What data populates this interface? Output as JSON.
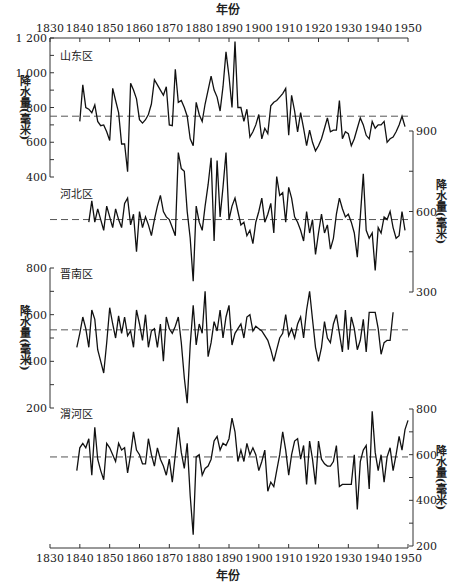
{
  "chart_data": {
    "type": "line",
    "title": "",
    "xlabel_top": "年份",
    "xlabel_bottom": "年份",
    "x_ticks": [
      1830,
      1840,
      1850,
      1860,
      1870,
      1880,
      1890,
      1900,
      1910,
      1920,
      1930,
      1940,
      1950
    ],
    "xlim": [
      1830,
      1950
    ],
    "panels": [
      {
        "name": "山东区",
        "axis_side": "left",
        "ylabel": "降水量(毫米)",
        "yticks": [
          400,
          600,
          800,
          1000,
          1200
        ],
        "ytick_labels": [
          "400",
          "600",
          "800",
          "1 000",
          "1 200"
        ],
        "ylim": [
          400,
          1200
        ],
        "mean": 750,
        "x": [
          1840,
          1841,
          1842,
          1843,
          1844,
          1845,
          1846,
          1847,
          1848,
          1849,
          1850,
          1851,
          1852,
          1853,
          1854,
          1855,
          1856,
          1857,
          1858,
          1859,
          1860,
          1861,
          1862,
          1863,
          1864,
          1865,
          1866,
          1867,
          1868,
          1869,
          1870,
          1871,
          1872,
          1873,
          1874,
          1875,
          1876,
          1877,
          1878,
          1879,
          1880,
          1881,
          1882,
          1883,
          1884,
          1885,
          1886,
          1887,
          1888,
          1889,
          1890,
          1891,
          1892,
          1893,
          1894,
          1895,
          1896,
          1897,
          1898,
          1899,
          1900,
          1901,
          1902,
          1903,
          1904,
          1905,
          1906,
          1907,
          1908,
          1909,
          1910,
          1911,
          1912,
          1913,
          1914,
          1915,
          1916,
          1917,
          1918,
          1919,
          1920,
          1921,
          1922,
          1923,
          1924,
          1925,
          1926,
          1927,
          1928,
          1929,
          1930,
          1931,
          1932,
          1933,
          1934,
          1935,
          1936,
          1937,
          1938,
          1939,
          1940,
          1941,
          1942,
          1943,
          1944,
          1945,
          1946,
          1947,
          1948,
          1949
        ],
        "values": [
          720,
          930,
          800,
          790,
          770,
          815,
          720,
          695,
          700,
          660,
          610,
          910,
          840,
          770,
          590,
          590,
          430,
          940,
          900,
          850,
          730,
          710,
          730,
          760,
          820,
          960,
          930,
          900,
          870,
          920,
          700,
          695,
          1020,
          830,
          840,
          800,
          750,
          620,
          580,
          830,
          760,
          720,
          820,
          900,
          980,
          900,
          860,
          780,
          920,
          1120,
          980,
          800,
          1180,
          800,
          800,
          720,
          790,
          630,
          660,
          700,
          760,
          620,
          680,
          650,
          810,
          830,
          840,
          860,
          880,
          910,
          640,
          870,
          780,
          660,
          770,
          680,
          580,
          670,
          600,
          550,
          580,
          620,
          680,
          740,
          660,
          670,
          670,
          840,
          620,
          660,
          650,
          580,
          620,
          680,
          740,
          700,
          640,
          620,
          720,
          680,
          700,
          700,
          720,
          600,
          620,
          630,
          660,
          700,
          750,
          690
        ]
      },
      {
        "name": "河北区",
        "axis_side": "right",
        "ylabel": "降水量(毫米)",
        "yticks": [
          300,
          600,
          900
        ],
        "ytick_labels": [
          "300",
          "600",
          "900"
        ],
        "ylim": [
          300,
          900
        ],
        "mean": 570,
        "x": [
          1843,
          1844,
          1845,
          1846,
          1847,
          1848,
          1849,
          1850,
          1851,
          1852,
          1853,
          1854,
          1855,
          1856,
          1857,
          1858,
          1859,
          1860,
          1861,
          1862,
          1863,
          1864,
          1865,
          1866,
          1867,
          1868,
          1869,
          1870,
          1871,
          1872,
          1873,
          1874,
          1875,
          1876,
          1877,
          1878,
          1879,
          1880,
          1881,
          1882,
          1883,
          1884,
          1885,
          1886,
          1887,
          1888,
          1889,
          1890,
          1891,
          1892,
          1893,
          1894,
          1895,
          1896,
          1897,
          1898,
          1899,
          1900,
          1901,
          1902,
          1903,
          1904,
          1905,
          1906,
          1907,
          1908,
          1909,
          1910,
          1911,
          1912,
          1913,
          1914,
          1915,
          1916,
          1917,
          1918,
          1919,
          1920,
          1921,
          1922,
          1923,
          1924,
          1925,
          1926,
          1927,
          1928,
          1929,
          1930,
          1931,
          1932,
          1933,
          1934,
          1935,
          1936,
          1937,
          1938,
          1939,
          1940,
          1941,
          1942,
          1943,
          1944,
          1945,
          1946,
          1947,
          1948,
          1949
        ],
        "values": [
          560,
          640,
          560,
          610,
          570,
          530,
          620,
          580,
          540,
          610,
          570,
          540,
          630,
          650,
          550,
          590,
          450,
          600,
          540,
          580,
          550,
          510,
          570,
          620,
          660,
          600,
          580,
          570,
          540,
          510,
          820,
          760,
          750,
          600,
          500,
          340,
          620,
          560,
          530,
          620,
          700,
          800,
          490,
          790,
          580,
          690,
          820,
          570,
          620,
          650,
          600,
          550,
          560,
          510,
          530,
          480,
          560,
          600,
          650,
          560,
          590,
          630,
          520,
          730,
          660,
          670,
          560,
          690,
          650,
          580,
          560,
          530,
          490,
          600,
          520,
          570,
          440,
          520,
          590,
          520,
          550,
          460,
          500,
          590,
          650,
          610,
          580,
          590,
          560,
          520,
          430,
          580,
          740,
          530,
          500,
          520,
          380,
          540,
          520,
          580,
          570,
          600,
          540,
          500,
          510,
          600,
          530
        ]
      },
      {
        "name": "晋南区",
        "axis_side": "left",
        "ylabel": "降水量(毫米)",
        "yticks": [
          200,
          400,
          600,
          800
        ],
        "ytick_labels": [
          "200",
          "400",
          "600",
          "800"
        ],
        "ylim": [
          200,
          800
        ],
        "mean": 535,
        "x": [
          1839,
          1840,
          1841,
          1842,
          1843,
          1844,
          1845,
          1846,
          1847,
          1848,
          1849,
          1850,
          1851,
          1852,
          1853,
          1854,
          1855,
          1856,
          1857,
          1858,
          1859,
          1860,
          1861,
          1862,
          1863,
          1864,
          1865,
          1866,
          1867,
          1868,
          1869,
          1870,
          1871,
          1872,
          1873,
          1874,
          1875,
          1876,
          1877,
          1878,
          1879,
          1880,
          1881,
          1882,
          1883,
          1884,
          1885,
          1886,
          1887,
          1888,
          1889,
          1890,
          1891,
          1892,
          1893,
          1894,
          1895,
          1896,
          1897,
          1898,
          1899,
          1900,
          1901,
          1902,
          1903,
          1904,
          1905,
          1906,
          1907,
          1908,
          1909,
          1910,
          1911,
          1912,
          1913,
          1914,
          1915,
          1916,
          1917,
          1918,
          1919,
          1920,
          1921,
          1922,
          1923,
          1924,
          1925,
          1926,
          1927,
          1928,
          1929,
          1930,
          1931,
          1932,
          1933,
          1934,
          1935,
          1936,
          1937,
          1938,
          1939,
          1940,
          1941,
          1942,
          1943,
          1944,
          1945,
          1946,
          1947,
          1948,
          1949
        ],
        "values": [
          460,
          520,
          590,
          540,
          460,
          620,
          580,
          450,
          400,
          350,
          480,
          630,
          560,
          500,
          595,
          520,
          590,
          510,
          530,
          460,
          620,
          560,
          490,
          600,
          460,
          530,
          540,
          460,
          560,
          400,
          590,
          540,
          520,
          550,
          590,
          480,
          330,
          220,
          470,
          640,
          470,
          560,
          520,
          700,
          420,
          480,
          570,
          530,
          620,
          500,
          590,
          640,
          470,
          520,
          540,
          560,
          500,
          590,
          600,
          530,
          550,
          540,
          530,
          510,
          490,
          450,
          400,
          450,
          500,
          520,
          600,
          510,
          540,
          500,
          560,
          590,
          500,
          620,
          700,
          580,
          460,
          400,
          460,
          570,
          500,
          480,
          560,
          600,
          520,
          440,
          620,
          450,
          590,
          540,
          450,
          490,
          580,
          440,
          610,
          610,
          610,
          540,
          430,
          480,
          490,
          490,
          610
        ]
      },
      {
        "name": "渭河区",
        "axis_side": "right",
        "ylabel": "降水量(毫米)",
        "yticks": [
          200,
          400,
          600,
          800
        ],
        "ytick_labels": [
          "200",
          "400",
          "600",
          "800"
        ],
        "ylim": [
          200,
          800
        ],
        "mean": 590,
        "x": [
          1839,
          1840,
          1841,
          1842,
          1843,
          1844,
          1845,
          1846,
          1847,
          1848,
          1849,
          1850,
          1851,
          1852,
          1853,
          1854,
          1855,
          1856,
          1857,
          1858,
          1859,
          1860,
          1861,
          1862,
          1863,
          1864,
          1865,
          1866,
          1867,
          1868,
          1869,
          1870,
          1871,
          1872,
          1873,
          1874,
          1875,
          1876,
          1877,
          1878,
          1879,
          1880,
          1881,
          1882,
          1883,
          1884,
          1885,
          1886,
          1887,
          1888,
          1889,
          1890,
          1891,
          1892,
          1893,
          1894,
          1895,
          1896,
          1897,
          1898,
          1899,
          1900,
          1901,
          1902,
          1903,
          1904,
          1905,
          1906,
          1907,
          1908,
          1909,
          1910,
          1911,
          1912,
          1913,
          1914,
          1915,
          1916,
          1917,
          1918,
          1919,
          1920,
          1921,
          1922,
          1923,
          1924,
          1925,
          1926,
          1927,
          1928,
          1929,
          1930,
          1931,
          1932,
          1933,
          1934,
          1935,
          1936,
          1937,
          1938,
          1939,
          1940,
          1941,
          1942,
          1943,
          1944,
          1945,
          1946,
          1947,
          1948,
          1949,
          1950
        ],
        "values": [
          530,
          630,
          650,
          630,
          670,
          510,
          720,
          580,
          530,
          490,
          650,
          630,
          600,
          570,
          650,
          620,
          630,
          520,
          600,
          700,
          620,
          600,
          560,
          560,
          670,
          600,
          550,
          630,
          580,
          550,
          510,
          580,
          480,
          600,
          720,
          610,
          540,
          650,
          420,
          250,
          590,
          600,
          510,
          540,
          550,
          580,
          660,
          680,
          620,
          650,
          640,
          670,
          760,
          700,
          570,
          620,
          570,
          650,
          600,
          630,
          600,
          530,
          570,
          620,
          440,
          480,
          460,
          530,
          600,
          700,
          620,
          510,
          600,
          660,
          670,
          580,
          640,
          470,
          660,
          580,
          470,
          660,
          580,
          560,
          550,
          550,
          570,
          640,
          460,
          470,
          470,
          470,
          470,
          600,
          360,
          570,
          620,
          640,
          450,
          790,
          610,
          530,
          600,
          480,
          590,
          630,
          530,
          600,
          680,
          620,
          710,
          750
        ]
      }
    ]
  },
  "labels": {
    "top_axis_title": "年份",
    "bottom_axis_title": "年份",
    "panel_names": [
      "山东区",
      "河北区",
      "晋南区",
      "渭河区"
    ],
    "ylabel": "降水量(毫米)"
  }
}
